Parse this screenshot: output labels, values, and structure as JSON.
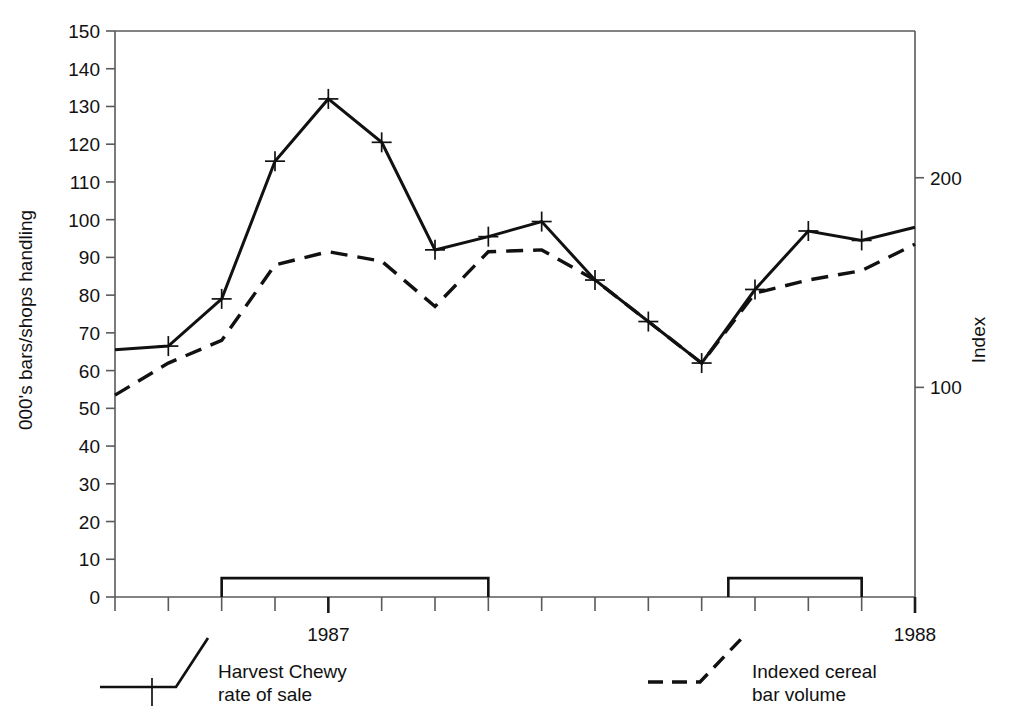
{
  "chart_data": {
    "type": "line",
    "title": "",
    "subtitle": "",
    "xlabel": "",
    "ylabel": "000's bars/shops handling",
    "y2label": "Index",
    "ylim": [
      0,
      150
    ],
    "y2lim": [
      0,
      270
    ],
    "yticks": [
      0,
      10,
      20,
      30,
      40,
      50,
      60,
      70,
      80,
      90,
      100,
      110,
      120,
      130,
      140,
      150
    ],
    "ytick_labels": [
      "0",
      "10",
      "20",
      "30",
      "40",
      "50",
      "60",
      "70",
      "80",
      "90",
      "100",
      "110",
      "120",
      "130",
      "140",
      "150"
    ],
    "y2ticks": [
      100,
      200
    ],
    "y2tick_labels": [
      "100",
      "200"
    ],
    "xtick_labels": [
      "1987",
      "1988"
    ],
    "xtick_label_positions": [
      4,
      15
    ],
    "x_periods": 15,
    "grid": false,
    "legend_position": "below-axes",
    "series": [
      {
        "name": "Harvest Chewy rate of sale",
        "style": "solid",
        "marker": "plus",
        "axis": "left",
        "values": [
          65.5,
          66.5,
          79,
          115.5,
          132,
          120.5,
          92,
          95.5,
          99.5,
          84,
          73,
          62,
          81.5,
          97,
          94.5,
          98
        ]
      },
      {
        "name": "Indexed cereal bar volume",
        "style": "dashed",
        "marker": "none",
        "axis": "right",
        "values": [
          53.5,
          62,
          68,
          88,
          91.5,
          89,
          77,
          91.5,
          92,
          84,
          73,
          62,
          80.5,
          84,
          86.5,
          93.5
        ]
      }
    ],
    "annotations": [
      {
        "name": "promotion-period-box-1",
        "start_period": 2,
        "end_period": 7,
        "height": 5
      },
      {
        "name": "promotion-period-box-2",
        "start_period": 11.5,
        "end_period": 14,
        "height": 5
      }
    ]
  },
  "legend": {
    "items": [
      {
        "label_line1": "Harvest Chewy",
        "label_line2": "rate of sale",
        "style": "solid"
      },
      {
        "label_line1": "Indexed cereal",
        "label_line2": "bar volume",
        "style": "dashed"
      }
    ]
  },
  "colors": {
    "ink": "#111111",
    "axis": "#5a5a5a",
    "background": "#ffffff"
  }
}
